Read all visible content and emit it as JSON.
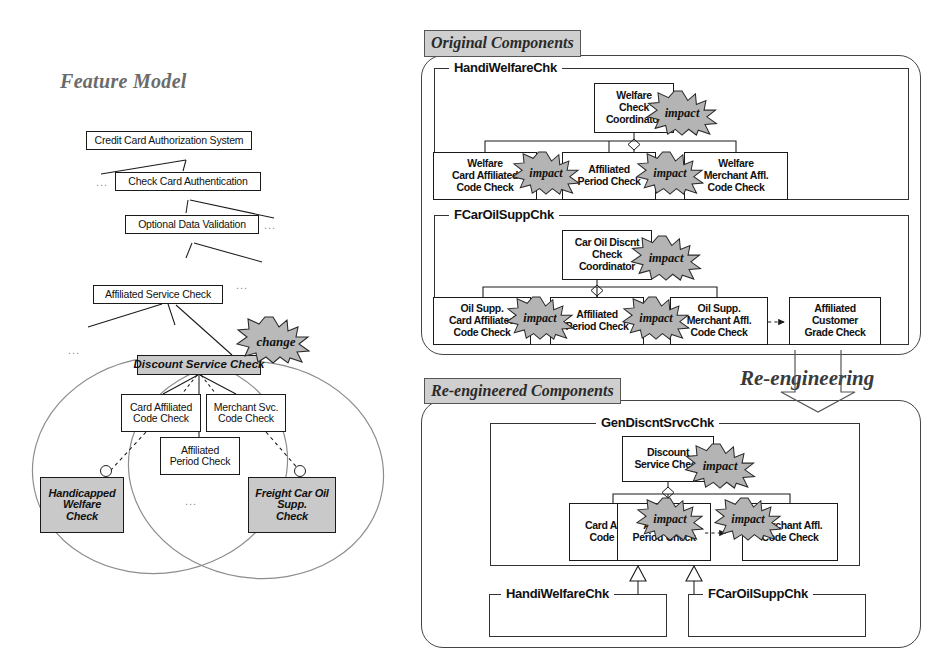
{
  "figure": {
    "background": "#ffffff",
    "line_color": "#1a1a1a",
    "shade_color": "#c9c9c9",
    "tab_color": "#cfcfcf"
  },
  "titles": {
    "feature_model": "Feature Model",
    "original_components": "Original Components",
    "reengineered_components": "Re-engineered Components",
    "reengineering": "Re-engineering"
  },
  "feature_model": {
    "nodes": [
      {
        "id": "ccas",
        "label": "Credit Card Authorization System"
      },
      {
        "id": "ccauth",
        "label": "Check Card Authentication"
      },
      {
        "id": "odv",
        "label": "Optional Data Validation"
      },
      {
        "id": "asc",
        "label": "Affiliated Service Check"
      },
      {
        "id": "dsc",
        "label": "Discount Service Check"
      },
      {
        "id": "cacc",
        "label": "Card Affiliated\nCode Check"
      },
      {
        "id": "msc",
        "label": "Merchant Svc.\nCode Check"
      },
      {
        "id": "apc",
        "label": "Affiliated\nPeriod Check"
      },
      {
        "id": "hwc",
        "label": "Handicapped\nWelfare\nCheck"
      },
      {
        "id": "fcos",
        "label": "Freight Car Oil\nSupp.\nCheck"
      }
    ],
    "change_badge": "change",
    "ellipsis": "...",
    "variant_ellipses": 2
  },
  "original_components": {
    "packages": [
      {
        "name": "HandiWelfareChk",
        "coordinator": "Welfare\nCheck\nCoordinator",
        "parts": [
          "Welfare\nCard Affiliated\nCode Check",
          "Affiliated\nPeriod Check",
          "Welfare\nMerchant Affl.\nCode Check"
        ],
        "impacts": 3
      },
      {
        "name": "FCarOilSuppChk",
        "coordinator": "Car Oil Discnt\nCheck\nCoordinator",
        "parts": [
          "Oil Supp.\nCard Affiliated\nCode Check",
          "Affiliated\nPeriod Check",
          "Oil Supp.\nMerchant Affl.\nCode Check",
          "Affiliated\nCustomer\nGrade Check"
        ],
        "impacts": 3
      }
    ]
  },
  "reengineered_components": {
    "package": {
      "name": "GenDiscntSrvcChk",
      "coordinator": "Discount\nService Check",
      "parts": [
        "Card Affiliated\nCode Check",
        "Affiliated\nPeriod Check",
        "Merchant Affl.\nCode Check"
      ],
      "impacts": 3
    },
    "subpackages": [
      {
        "name": "HandiWelfareChk"
      },
      {
        "name": "FCarOilSuppChk"
      }
    ]
  },
  "badges": {
    "impact": "impact",
    "change": "change"
  }
}
